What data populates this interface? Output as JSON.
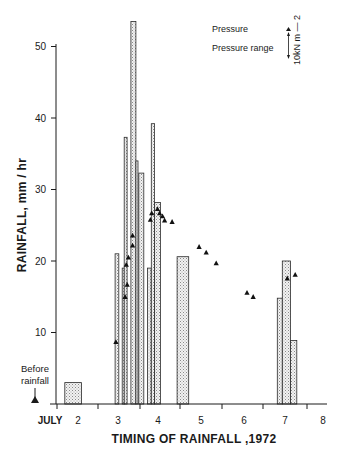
{
  "chart_data": {
    "type": "bar",
    "title": "",
    "xlabel": "TIMING OF RAINFALL ,1972",
    "ylabel": "RAINFALL, mm / hr",
    "ylim": [
      0,
      53
    ],
    "yticks": [
      10,
      20,
      30,
      40,
      50
    ],
    "xtick_labels": [
      "JULY",
      "2",
      "3",
      "4",
      "5",
      "6",
      "7",
      "8"
    ],
    "grid": false,
    "legend_position": "top-right",
    "legend": [
      {
        "label": "Pressure",
        "marker": "triangle"
      },
      {
        "label": "Pressure range",
        "marker": "double-arrow"
      }
    ],
    "scale_label": "10kN m⁻²",
    "annotation": "Before rainfall",
    "series": [
      {
        "name": "Rainfall intensity (mm/hr)",
        "kind": "bars",
        "bars": [
          {
            "x0": 1.72,
            "x1": 2.12,
            "value": 3.0
          },
          {
            "x0": 2.93,
            "x1": 3.02,
            "value": 21.0
          },
          {
            "x0": 3.1,
            "x1": 3.15,
            "value": 19.0
          },
          {
            "x0": 3.15,
            "x1": 3.22,
            "value": 37.3
          },
          {
            "x0": 3.31,
            "x1": 3.43,
            "value": 53.5
          },
          {
            "x0": 3.43,
            "x1": 3.48,
            "value": 34.0
          },
          {
            "x0": 3.5,
            "x1": 3.62,
            "value": 32.3
          },
          {
            "x0": 3.71,
            "x1": 3.8,
            "value": 19.0
          },
          {
            "x0": 3.8,
            "x1": 3.88,
            "value": 39.2
          },
          {
            "x0": 3.88,
            "x1": 4.02,
            "value": 28.2
          },
          {
            "x0": 4.42,
            "x1": 4.7,
            "value": 20.6
          },
          {
            "x0": 6.83,
            "x1": 6.95,
            "value": 14.8
          },
          {
            "x0": 6.95,
            "x1": 7.15,
            "value": 20.0
          },
          {
            "x0": 7.15,
            "x1": 7.3,
            "value": 8.9
          }
        ]
      },
      {
        "name": "Pressure",
        "kind": "scatter",
        "points": [
          {
            "x": 2.95,
            "y": 8.7
          },
          {
            "x": 3.17,
            "y": 15.0
          },
          {
            "x": 3.2,
            "y": 19.5
          },
          {
            "x": 3.22,
            "y": 16.7
          },
          {
            "x": 3.25,
            "y": 20.5
          },
          {
            "x": 3.35,
            "y": 22.2
          },
          {
            "x": 3.35,
            "y": 23.6
          },
          {
            "x": 3.78,
            "y": 25.8
          },
          {
            "x": 3.81,
            "y": 26.7
          },
          {
            "x": 3.95,
            "y": 27.3
          },
          {
            "x": 4.0,
            "y": 26.7
          },
          {
            "x": 4.07,
            "y": 26.3
          },
          {
            "x": 4.12,
            "y": 25.7
          },
          {
            "x": 4.3,
            "y": 25.5
          },
          {
            "x": 4.95,
            "y": 22.0
          },
          {
            "x": 5.12,
            "y": 21.2
          },
          {
            "x": 5.36,
            "y": 19.7
          },
          {
            "x": 6.1,
            "y": 15.6
          },
          {
            "x": 6.25,
            "y": 15.0
          },
          {
            "x": 7.07,
            "y": 17.6
          },
          {
            "x": 7.26,
            "y": 18.1
          }
        ],
        "before_rainfall_point": {
          "y": 0
        }
      }
    ]
  },
  "axis": {
    "x_title": "TIMING OF RAINFALL ,1972",
    "y_title": "RAINFALL, mm / hr",
    "y_ticks": [
      "10",
      "20",
      "30",
      "40",
      "50"
    ],
    "x_ticks": [
      "JULY",
      "2",
      "3",
      "4",
      "5",
      "6",
      "7",
      "8"
    ]
  },
  "legend": {
    "pressure": "Pressure",
    "pressure_range": "Pressure range",
    "scale": "10kN m — 2"
  },
  "annotation": {
    "before_line1": "Before",
    "before_line2": "rainfall"
  }
}
